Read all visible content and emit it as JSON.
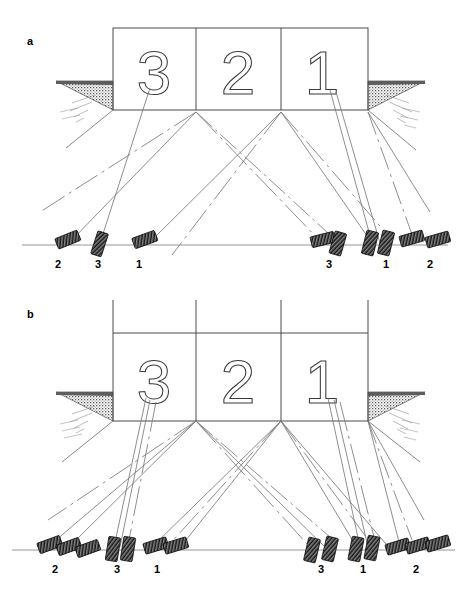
{
  "figure": {
    "type": "technical-line-drawing",
    "width": 467,
    "height": 594,
    "background_color": "#ffffff",
    "line_color": "#4a4a4a",
    "ray_color": "#777777",
    "marker_color": "#1a1a1a",
    "hatch_color": "#6b6b6b"
  },
  "panels": [
    {
      "id": "a",
      "letter": "a",
      "letter_x": 27,
      "letter_y": 45,
      "wall": {
        "left": 113,
        "right": 368,
        "top": 28,
        "bottom": 110,
        "dividers": [
          196,
          281
        ],
        "has_upper_extension": false
      },
      "bays": [
        {
          "digit": "3",
          "cx": 154,
          "cy": 72
        },
        {
          "digit": "2",
          "cx": 238,
          "cy": 72
        },
        {
          "digit": "1",
          "cx": 322,
          "cy": 72
        }
      ],
      "ground_line": {
        "y": 245,
        "x1": 22,
        "x2": 448
      },
      "stations": [
        {
          "label": "2",
          "label_x": 58,
          "label_y": 268,
          "markers": 1,
          "side": "left"
        },
        {
          "label": "3",
          "label_x": 98,
          "label_y": 268,
          "markers": 1,
          "side": "left"
        },
        {
          "label": "1",
          "label_x": 139,
          "label_y": 268,
          "markers": 1,
          "side": "left"
        },
        {
          "label": "3",
          "label_x": 329,
          "label_y": 268,
          "markers": 2,
          "side": "right"
        },
        {
          "label": "1",
          "label_x": 386,
          "label_y": 268,
          "markers": 2,
          "side": "right"
        },
        {
          "label": "2",
          "label_x": 430,
          "label_y": 268,
          "markers": 2,
          "side": "right"
        }
      ],
      "marker_count_total": 9,
      "rays_per_fan": 2
    },
    {
      "id": "b",
      "letter": "b",
      "letter_x": 27,
      "letter_y": 318,
      "wall": {
        "left": 113,
        "right": 368,
        "top": 300,
        "upper_rule": 333,
        "bottom": 421,
        "dividers": [
          196,
          281
        ],
        "has_upper_extension": true
      },
      "bays": [
        {
          "digit": "3",
          "cx": 154,
          "cy": 381
        },
        {
          "digit": "2",
          "cx": 238,
          "cy": 381
        },
        {
          "digit": "1",
          "cx": 322,
          "cy": 381
        }
      ],
      "ground_line": {
        "y": 550,
        "x1": 12,
        "x2": 455
      },
      "stations": [
        {
          "label": "2",
          "label_x": 55,
          "label_y": 573,
          "markers": 3,
          "side": "left"
        },
        {
          "label": "3",
          "label_x": 117,
          "label_y": 573,
          "markers": 2,
          "side": "left"
        },
        {
          "label": "1",
          "label_x": 157,
          "label_y": 573,
          "markers": 2,
          "side": "left"
        },
        {
          "label": "3",
          "label_x": 321,
          "label_y": 573,
          "markers": 2,
          "side": "right"
        },
        {
          "label": "1",
          "label_x": 363,
          "label_y": 573,
          "markers": 2,
          "side": "right"
        },
        {
          "label": "2",
          "label_x": 416,
          "label_y": 573,
          "markers": 3,
          "side": "right"
        }
      ],
      "marker_count_total": 14,
      "rays_per_fan": 3
    }
  ],
  "legend": {
    "wall_digits": [
      "3",
      "2",
      "1"
    ],
    "station_numbers": [
      "1",
      "2",
      "3"
    ],
    "panel_letters": [
      "a",
      "b"
    ]
  }
}
